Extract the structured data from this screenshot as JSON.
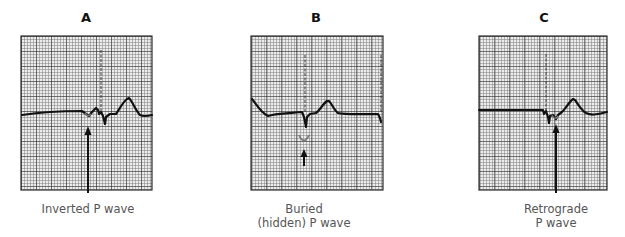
{
  "figure": {
    "panels": [
      {
        "id": "A",
        "label": "A",
        "caption_lines": [
          "Inverted P wave"
        ],
        "annotation": "inverted-p-wave"
      },
      {
        "id": "B",
        "label": "B",
        "caption_lines": [
          "Buried",
          "(hidden) P wave"
        ],
        "annotation": "buried-p-wave"
      },
      {
        "id": "C",
        "label": "C",
        "caption_lines": [
          "Retrograde",
          "P wave"
        ],
        "annotation": "retrograde-p-wave"
      }
    ],
    "colors": {
      "grid_minor": "#9a9a9a",
      "grid_major": "#3a3a3a",
      "grid_bg": "#e6e6e6",
      "trace": "#111111",
      "caption_text": "#555555"
    }
  }
}
